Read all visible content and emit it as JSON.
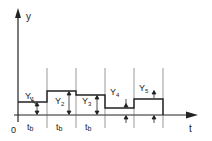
{
  "diagram": {
    "axes": {
      "y_label": "y",
      "x_label": "t",
      "origin_label": "0"
    },
    "segments": [
      {
        "label": "Y",
        "sub": "1",
        "interval_label": "t",
        "interval_sub": "b"
      },
      {
        "label": "Y",
        "sub": "2",
        "interval_label": "t",
        "interval_sub": "b"
      },
      {
        "label": "Y",
        "sub": "3",
        "interval_label": "t",
        "interval_sub": "b"
      },
      {
        "label": "Y",
        "sub": "4",
        "interval_label": "",
        "interval_sub": ""
      },
      {
        "label": "Y",
        "sub": "5",
        "interval_label": "",
        "interval_sub": ""
      }
    ],
    "colors": {
      "line": "#222222",
      "background": "#ffffff"
    }
  }
}
